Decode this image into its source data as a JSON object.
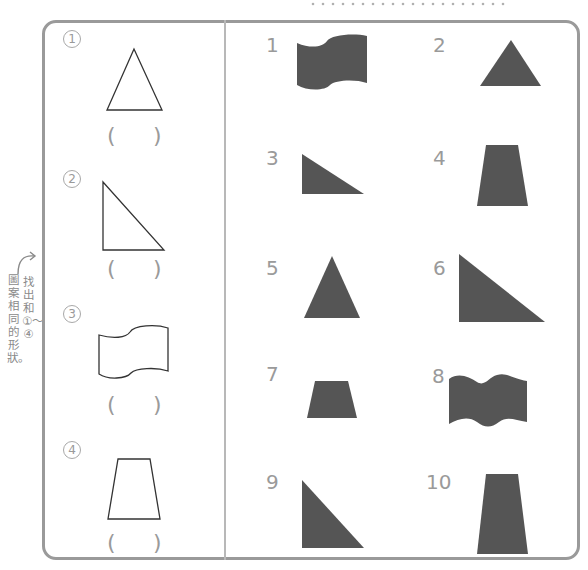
{
  "instruction": {
    "text": "找出和①〜④圖案相同的形狀。",
    "line1": "找出和①〜④",
    "line2": "圖案相同的形狀。"
  },
  "questions": [
    {
      "number": "1",
      "shape": "triangle-isosceles",
      "answer_open": "(",
      "answer_close": ")"
    },
    {
      "number": "2",
      "shape": "triangle-right",
      "answer_open": "(",
      "answer_close": ")"
    },
    {
      "number": "3",
      "shape": "flag-wave",
      "answer_open": "(",
      "answer_close": ")"
    },
    {
      "number": "4",
      "shape": "trapezoid",
      "answer_open": "(",
      "answer_close": ")"
    }
  ],
  "options": [
    {
      "number": "1",
      "shape": "flag-wave-filled"
    },
    {
      "number": "2",
      "shape": "triangle-filled"
    },
    {
      "number": "3",
      "shape": "right-triangle-small-filled"
    },
    {
      "number": "4",
      "shape": "trapezoid-filled"
    },
    {
      "number": "5",
      "shape": "triangle-isosceles-filled"
    },
    {
      "number": "6",
      "shape": "right-triangle-large-filled"
    },
    {
      "number": "7",
      "shape": "trapezoid-small-filled"
    },
    {
      "number": "8",
      "shape": "double-wave-filled"
    },
    {
      "number": "9",
      "shape": "right-triangle-tall-filled"
    },
    {
      "number": "10",
      "shape": "trapezoid-tall-filled"
    }
  ],
  "colors": {
    "frame": "#9a9a9a",
    "divider": "#b8b8b8",
    "label": "#9a9a9a",
    "shape_fill": "#555555",
    "shape_outline": "#333333"
  }
}
